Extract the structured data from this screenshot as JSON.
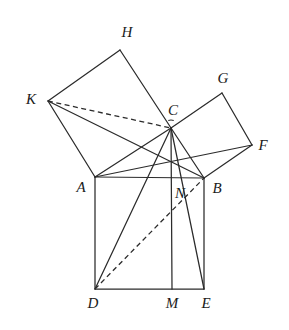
{
  "figure": {
    "background_color": "#ffffff",
    "stroke_color": "#2b2b2b",
    "width": 289,
    "height": 330,
    "points": {
      "A": {
        "x": 95,
        "y": 177
      },
      "B": {
        "x": 204,
        "y": 178
      },
      "C": {
        "x": 171,
        "y": 128
      },
      "D": {
        "x": 95,
        "y": 289
      },
      "E": {
        "x": 204,
        "y": 289
      },
      "F": {
        "x": 252,
        "y": 145
      },
      "G": {
        "x": 222,
        "y": 93
      },
      "H": {
        "x": 120,
        "y": 50
      },
      "K": {
        "x": 48,
        "y": 101
      },
      "M": {
        "x": 172,
        "y": 289
      },
      "N": {
        "x": 172,
        "y": 178
      }
    },
    "labels": [
      {
        "name": "H",
        "text": "H",
        "x": 127,
        "y": 32
      },
      {
        "name": "G",
        "text": "G",
        "x": 223,
        "y": 78
      },
      {
        "name": "K",
        "text": "K",
        "x": 31,
        "y": 99
      },
      {
        "name": "C",
        "text": "C",
        "x": 173,
        "y": 110
      },
      {
        "name": "F",
        "text": "F",
        "x": 263,
        "y": 145
      },
      {
        "name": "A",
        "text": "A",
        "x": 81,
        "y": 187
      },
      {
        "name": "N",
        "text": "N",
        "x": 180,
        "y": 193
      },
      {
        "name": "B",
        "text": "B",
        "x": 217,
        "y": 188
      },
      {
        "name": "D",
        "text": "D",
        "x": 93,
        "y": 303
      },
      {
        "name": "M",
        "text": "M",
        "x": 172,
        "y": 303
      },
      {
        "name": "E",
        "text": "E",
        "x": 206,
        "y": 303
      }
    ],
    "solid_segments": [
      {
        "name": "segment-A-B",
        "from": "A",
        "to": "B"
      },
      {
        "name": "segment-A-D",
        "from": "A",
        "to": "D"
      },
      {
        "name": "segment-B-E",
        "from": "B",
        "to": "E"
      },
      {
        "name": "segment-D-E",
        "from": "D",
        "to": "E"
      },
      {
        "name": "segment-A-K",
        "from": "A",
        "to": "K"
      },
      {
        "name": "segment-K-H",
        "from": "K",
        "to": "H"
      },
      {
        "name": "segment-H-C",
        "from": "H",
        "to": "C"
      },
      {
        "name": "segment-C-A",
        "from": "C",
        "to": "A"
      },
      {
        "name": "segment-C-G",
        "from": "C",
        "to": "G"
      },
      {
        "name": "segment-G-F",
        "from": "G",
        "to": "F"
      },
      {
        "name": "segment-F-B",
        "from": "F",
        "to": "B"
      },
      {
        "name": "segment-B-C",
        "from": "B",
        "to": "C"
      },
      {
        "name": "segment-K-B",
        "from": "K",
        "to": "B"
      },
      {
        "name": "segment-A-F",
        "from": "A",
        "to": "F"
      },
      {
        "name": "segment-C-M",
        "from": "C",
        "to": "M"
      },
      {
        "name": "segment-C-D",
        "from": "C",
        "to": "D"
      },
      {
        "name": "segment-C-E",
        "from": "C",
        "to": "E"
      }
    ],
    "dashed_segments": [
      {
        "name": "segment-K-C-dashed",
        "from": "K",
        "to": "C"
      },
      {
        "name": "segment-D-B-dashed",
        "from": "D",
        "to": "B"
      }
    ],
    "angle_marker": {
      "name": "right-angle-arc-at-C",
      "cx": 171,
      "cy": 128,
      "r": 8,
      "start_deg": 250,
      "end_deg": 290
    }
  }
}
